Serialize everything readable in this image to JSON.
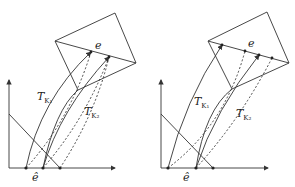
{
  "panels": [
    {
      "id": "left",
      "labels": {
        "edge": "e",
        "ref_edge": "ê",
        "t1": "T",
        "t1_sub": "K₁",
        "t2": "T",
        "t2_sub": "K₂"
      }
    },
    {
      "id": "right",
      "labels": {
        "edge": "e",
        "ref_edge": "ê",
        "t1": "T",
        "t1_sub": "K₁",
        "t2": "T",
        "t2_sub": "K₂"
      }
    }
  ],
  "colors": {
    "stroke": "#333333",
    "background": "#ffffff"
  }
}
